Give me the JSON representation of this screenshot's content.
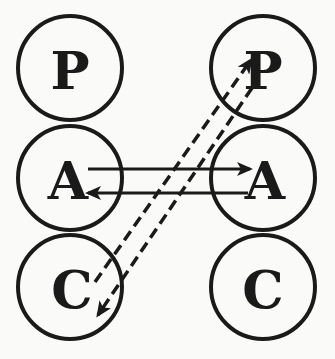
{
  "diagram": {
    "type": "transactional-analysis",
    "colors": {
      "ink": "#1a1a1a",
      "background": "#fafaf8"
    },
    "left_person": {
      "nodes": [
        {
          "id": "L-P",
          "label": "P",
          "cx": 70,
          "cy": 68
        },
        {
          "id": "L-A",
          "label": "A",
          "cx": 70,
          "cy": 178
        },
        {
          "id": "L-C",
          "label": "C",
          "cx": 70,
          "cy": 287
        }
      ]
    },
    "right_person": {
      "nodes": [
        {
          "id": "R-P",
          "label": "P",
          "cx": 263,
          "cy": 68
        },
        {
          "id": "R-A",
          "label": "A",
          "cx": 263,
          "cy": 178
        },
        {
          "id": "R-C",
          "label": "C",
          "cx": 263,
          "cy": 287
        }
      ]
    },
    "radius": 52,
    "edges": [
      {
        "from": "L-A",
        "to": "R-A",
        "style": "solid",
        "direction": "left-to-right"
      },
      {
        "from": "R-A",
        "to": "L-A",
        "style": "solid",
        "direction": "right-to-left"
      },
      {
        "from": "L-C",
        "to": "R-P",
        "style": "dashed",
        "direction": "up-right"
      },
      {
        "from": "R-P",
        "to": "L-C",
        "style": "dashed",
        "direction": "down-left"
      }
    ]
  }
}
